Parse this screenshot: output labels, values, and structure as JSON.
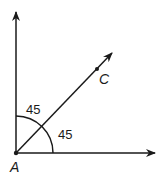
{
  "diagram": {
    "point_a": {
      "label": "A",
      "x": 16,
      "y": 153
    },
    "point_c": {
      "label": "C",
      "x": 97,
      "y": 69
    },
    "angles": [
      {
        "name": "upper-angle",
        "label": "45"
      },
      {
        "name": "lower-angle",
        "label": "45"
      }
    ],
    "rays": [
      {
        "name": "vertical-ray",
        "to": [
          16,
          11
        ]
      },
      {
        "name": "horizontal-ray",
        "to": [
          156,
          153
        ]
      },
      {
        "name": "diagonal-ray",
        "to": [
          113,
          52
        ]
      }
    ],
    "colors": {
      "stroke": "#1a1a1a",
      "background": "#ffffff"
    }
  }
}
